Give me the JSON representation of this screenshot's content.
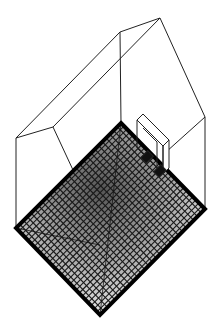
{
  "figure": {
    "colors": {
      "background": "#ffffff",
      "line": "#222222",
      "floor_border": "#000000",
      "grid": "#1a1a1a",
      "shade_dark": "#555555",
      "shade_light": "#f2f2f2"
    },
    "geometry": {
      "ridge_top": [
        160,
        18
      ],
      "ridge_left": [
        120,
        32
      ],
      "eave_left": [
        16,
        138
      ],
      "eave_left_inner": [
        53,
        127
      ],
      "eave_right": [
        205,
        117
      ],
      "floor": {
        "top": [
          121,
          123
        ],
        "right": [
          205,
          209
        ],
        "bottom": [
          100,
          315
        ],
        "left": [
          16,
          228
        ]
      },
      "grid_divisions": 28
    }
  }
}
